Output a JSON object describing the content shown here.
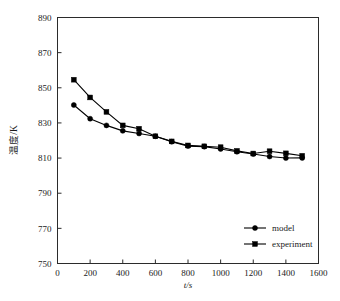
{
  "chart_data": {
    "type": "line",
    "title": "",
    "xlabel": "t/s",
    "ylabel": "温度/K",
    "xlim": [
      0,
      1600
    ],
    "ylim": [
      750,
      890
    ],
    "xticks": [
      0,
      200,
      400,
      600,
      800,
      1000,
      1200,
      1400,
      1600
    ],
    "yticks": [
      750,
      770,
      790,
      810,
      830,
      850,
      870,
      890
    ],
    "grid": false,
    "legend_position": "lower-right",
    "x": [
      100,
      200,
      300,
      400,
      500,
      600,
      700,
      800,
      900,
      1000,
      1100,
      1200,
      1300,
      1400,
      1500
    ],
    "series": [
      {
        "name": "model",
        "marker": "circle",
        "values": [
          840.2,
          832.4,
          828.6,
          825.5,
          824.0,
          822.4,
          819.3,
          816.8,
          816.5,
          815.2,
          813.6,
          812.3,
          810.9,
          810.0,
          810.1
        ]
      },
      {
        "name": "experiment",
        "marker": "square",
        "values": [
          854.6,
          844.5,
          836.3,
          828.6,
          826.7,
          822.4,
          819.5,
          817.2,
          816.7,
          816.2,
          814.1,
          812.6,
          813.9,
          812.7,
          811.3
        ]
      }
    ],
    "colors": {
      "line": "#000000",
      "marker": "#000000",
      "axis": "#2b2b2b",
      "text": "#1a1a1a",
      "background": "#ffffff"
    }
  },
  "legend": {
    "entries": [
      {
        "label": "model",
        "marker": "circle-marker"
      },
      {
        "label": "experiment",
        "marker": "square-marker"
      }
    ]
  },
  "axes": {
    "x_title": "t/s",
    "y_title": "温度/K",
    "x_tick_labels": [
      "0",
      "200",
      "400",
      "600",
      "800",
      "1000",
      "1200",
      "1400",
      "1600"
    ],
    "y_tick_labels": [
      "750",
      "770",
      "790",
      "810",
      "830",
      "850",
      "870",
      "890"
    ]
  }
}
